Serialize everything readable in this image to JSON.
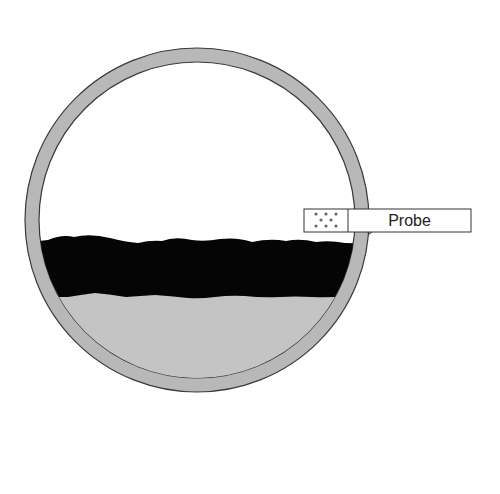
{
  "diagram": {
    "probe_label": "Probe",
    "colors": {
      "vessel_wall": "#b8b8b8",
      "vessel_stroke": "#3a3a3a",
      "interior": "#ffffff",
      "dark_layer": "#050505",
      "bottom_layer": "#c4c4c4",
      "probe_fill": "#ffffff",
      "dots": "#555555"
    }
  }
}
